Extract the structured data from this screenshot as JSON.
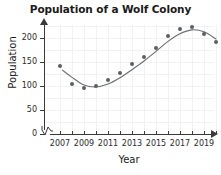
{
  "chart_data": {
    "type": "scatter",
    "title": "Population of a Wolf Colony",
    "xlabel": "Year",
    "ylabel": "Population",
    "x": [
      2007,
      2008,
      2009,
      2010,
      2011,
      2012,
      2013,
      2014,
      2015,
      2016,
      2017,
      2018,
      2019,
      2020
    ],
    "values": [
      142,
      105,
      96,
      100,
      112,
      128,
      145,
      160,
      180,
      205,
      218,
      222,
      208,
      192
    ],
    "xlim": [
      2006,
      2021
    ],
    "ylim": [
      0,
      230
    ],
    "xticks": [
      2007,
      2009,
      2011,
      2013,
      2015,
      2017,
      2019
    ],
    "xtick_labels": [
      "2007",
      "2009",
      "2011",
      "2013",
      "2015",
      "2017",
      "2019"
    ],
    "yticks": [
      0,
      50,
      100,
      150,
      200
    ],
    "ytick_labels": [
      "0",
      "50",
      "100",
      "150",
      "200"
    ],
    "grid": true,
    "legend": "none",
    "has_trend_line": true,
    "trend_description": "smooth S-shaped curve declining to a minimum near 2009-2010 then rising to a peak near 2017-2018 before declining",
    "marker_color": "#5c5f66",
    "trend_color": "#6b6e75",
    "grid_color": "#f2f2f4",
    "axis_color": "#3a3a3a",
    "axis_break_symbol": "zigzag"
  }
}
